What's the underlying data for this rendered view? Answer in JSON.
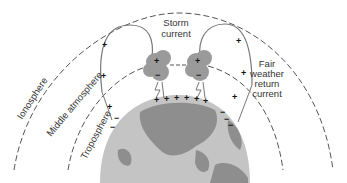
{
  "diagram": {
    "layers": [
      {
        "label": "Ionosphere"
      },
      {
        "label": "Middle atmosphere"
      },
      {
        "label": "Troposphere"
      }
    ],
    "labels": {
      "storm_current_line1": "Storm",
      "storm_current_line2": "current",
      "fair_weather_line1": "Fair",
      "fair_weather_line2": "weather",
      "fair_weather_line3": "return",
      "fair_weather_line4": "current"
    },
    "signs": {
      "plus": "+",
      "minus": "−"
    },
    "colors": {
      "dashed_lines": "#555555",
      "current_loops": "#777777",
      "cloud": "#9a9a9a",
      "earth_ocean": "#bdbdbd",
      "earth_land": "#8c8c8c",
      "text": "#333333"
    }
  }
}
